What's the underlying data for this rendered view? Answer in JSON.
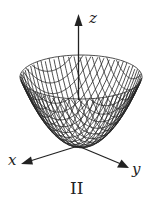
{
  "diagram": {
    "type": "3d-surface-wireframe",
    "surface": "paraboloid z = x^2 + y^2",
    "axes": {
      "z": {
        "label": "z"
      },
      "x": {
        "label": "x"
      },
      "y": {
        "label": "y"
      }
    },
    "caption": "II",
    "colors": {
      "line": "#222222",
      "background": "#ffffff"
    }
  }
}
